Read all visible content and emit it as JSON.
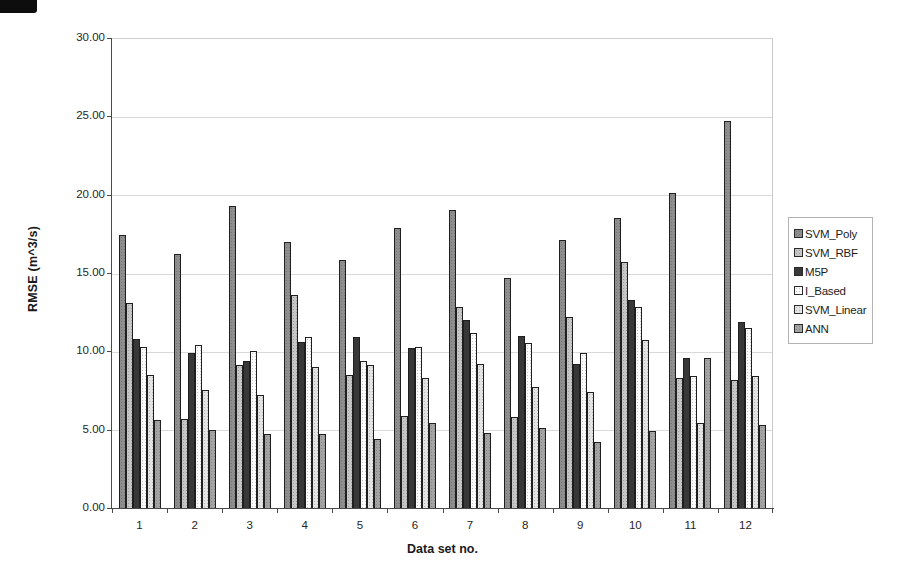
{
  "chart_data": {
    "type": "bar",
    "title": "",
    "xlabel": "Data set no.",
    "ylabel": "RMSE (m^3/s)",
    "ylim": [
      0,
      30
    ],
    "y_tick_step": 5,
    "y_tick_labels": [
      "0.00",
      "5.00",
      "10.00",
      "15.00",
      "20.00",
      "25.00",
      "30.00"
    ],
    "grid": "horizontal-on",
    "legend_position": "right-outside",
    "categories": [
      "1",
      "2",
      "3",
      "4",
      "5",
      "6",
      "7",
      "8",
      "9",
      "10",
      "11",
      "12"
    ],
    "series": [
      {
        "name": "SVM_Poly",
        "color": "#8e8e8e",
        "values": [
          17.4,
          16.2,
          19.3,
          17.0,
          15.8,
          17.9,
          19.0,
          14.7,
          17.1,
          18.5,
          20.1,
          24.7
        ]
      },
      {
        "name": "SVM_RBF",
        "color": "#c6c6c6",
        "values": [
          13.1,
          5.7,
          9.1,
          13.6,
          8.5,
          5.9,
          12.8,
          5.8,
          12.2,
          15.7,
          8.3,
          8.2
        ]
      },
      {
        "name": "M5P",
        "color": "#383838",
        "values": [
          10.8,
          9.9,
          9.4,
          10.6,
          10.9,
          10.2,
          12.0,
          11.0,
          9.2,
          13.3,
          9.6,
          11.9
        ]
      },
      {
        "name": "I_Based",
        "color": "#fcfcfc",
        "values": [
          10.3,
          10.4,
          10.0,
          10.9,
          9.4,
          10.3,
          11.2,
          10.5,
          9.9,
          12.8,
          8.4,
          11.5
        ]
      },
      {
        "name": "SVM_Linear",
        "color": "#e4e4e4",
        "values": [
          8.5,
          7.5,
          7.2,
          9.0,
          9.1,
          8.3,
          9.2,
          7.7,
          7.4,
          10.7,
          5.4,
          8.4
        ]
      },
      {
        "name": "ANN",
        "color": "#a3a3a3",
        "values": [
          5.6,
          5.0,
          4.7,
          4.7,
          4.4,
          5.4,
          4.8,
          5.1,
          4.2,
          4.9,
          9.6,
          5.3
        ]
      }
    ]
  }
}
